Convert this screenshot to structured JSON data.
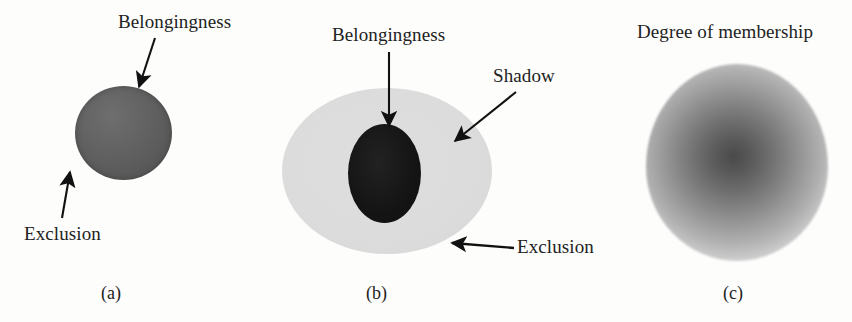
{
  "figure": {
    "background_color": "#fdfdfc",
    "panels": [
      {
        "id": "a",
        "caption": "(a)",
        "labels": [
          {
            "name": "belongingness",
            "text": "Belongingness"
          },
          {
            "name": "exclusion",
            "text": "Exclusion"
          }
        ],
        "shapes": [
          {
            "name": "crisp-set-circle",
            "fill": "#5e5e5e",
            "shape": "circle"
          }
        ]
      },
      {
        "id": "b",
        "caption": "(b)",
        "labels": [
          {
            "name": "belongingness",
            "text": "Belongingness"
          },
          {
            "name": "shadow",
            "text": "Shadow"
          },
          {
            "name": "exclusion",
            "text": "Exclusion"
          }
        ],
        "shapes": [
          {
            "name": "shadow-ellipse",
            "fill": "#dcdcdc",
            "shape": "ellipse"
          },
          {
            "name": "belongingness-ellipse",
            "fill": "#141414",
            "shape": "ellipse"
          }
        ]
      },
      {
        "id": "c",
        "caption": "(c)",
        "labels": [
          {
            "name": "degree-of-membership",
            "text": "Degree of membership"
          }
        ],
        "shapes": [
          {
            "name": "fuzzy-membership-blob",
            "fill_center": "#4a4a4a",
            "fill_edge": "#dcdcdc",
            "shape": "radial-gradient-ellipse"
          }
        ]
      }
    ]
  },
  "panel_a": {
    "label_belongingness": "Belongingness",
    "label_exclusion": "Exclusion",
    "caption": "(a)"
  },
  "panel_b": {
    "label_belongingness": "Belongingness",
    "label_shadow": "Shadow",
    "label_exclusion": "Exclusion",
    "caption": "(b)"
  },
  "panel_c": {
    "label_degree": "Degree of membership",
    "caption": "(c)"
  },
  "colors": {
    "crisp_gray": "#5e5e5e",
    "shadow_gray": "#dcdcdc",
    "core_black": "#141414",
    "arrow_black": "#111111",
    "text": "#222222",
    "background": "#fdfdfc"
  }
}
